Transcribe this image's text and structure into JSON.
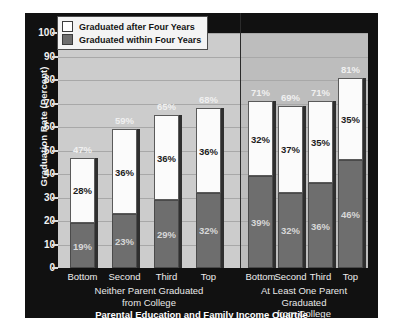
{
  "chart_data": {
    "type": "bar",
    "subtype": "stacked-grouped",
    "title": "",
    "xlabel": "Parental Education and Family Income Quartile",
    "ylabel": "Graduation Rate (Percent)",
    "ylim": [
      0,
      100
    ],
    "ytick_values": [
      0,
      10,
      20,
      30,
      40,
      50,
      60,
      70,
      80,
      90,
      100
    ],
    "ytick_labels": [
      "0",
      "10",
      "20",
      "30",
      "40",
      "50",
      "60",
      "70",
      "80",
      "90",
      "100"
    ],
    "grid": true,
    "legend_position": "upper-left-inside",
    "legend": [
      {
        "key": "after",
        "label": "Graduated after Four Years",
        "color": "#ffffff"
      },
      {
        "key": "within",
        "label": "Graduated within Four Years",
        "color": "#6e6e6e"
      }
    ],
    "categories": [
      "Bottom",
      "Second",
      "Third",
      "Top"
    ],
    "groups": [
      {
        "caption_line1": "Neither Parent Graduated",
        "caption_line2": "from College",
        "bars": [
          {
            "category": "Bottom",
            "within": 19,
            "after": 28,
            "total": 47,
            "within_label": "19%",
            "after_label": "28%",
            "total_label": "47%"
          },
          {
            "category": "Second",
            "within": 23,
            "after": 36,
            "total": 59,
            "within_label": "23%",
            "after_label": "36%",
            "total_label": "59%"
          },
          {
            "category": "Third",
            "within": 29,
            "after": 36,
            "total": 65,
            "within_label": "29%",
            "after_label": "36%",
            "total_label": "65%"
          },
          {
            "category": "Top",
            "within": 32,
            "after": 36,
            "total": 68,
            "within_label": "32%",
            "after_label": "36%",
            "total_label": "68%"
          }
        ]
      },
      {
        "caption_line1": "At Least One Parent Graduated",
        "caption_line2": "from College",
        "bars": [
          {
            "category": "Bottom",
            "within": 39,
            "after": 32,
            "total": 71,
            "within_label": "39%",
            "after_label": "32%",
            "total_label": "71%"
          },
          {
            "category": "Second",
            "within": 32,
            "after": 37,
            "total": 69,
            "within_label": "32%",
            "after_label": "37%",
            "total_label": "69%"
          },
          {
            "category": "Third",
            "within": 36,
            "after": 35,
            "total": 71,
            "within_label": "36%",
            "after_label": "35%",
            "total_label": "71%"
          },
          {
            "category": "Top",
            "within": 46,
            "after": 35,
            "total": 81,
            "within_label": "46%",
            "after_label": "35%",
            "total_label": "81%"
          }
        ]
      }
    ],
    "colors": {
      "panel_background": "#111111",
      "plot_background_left": "#cccccc",
      "plot_background_right": "#bdbdbd",
      "gridline": "#a8a8a8",
      "bar_after": "#fbfbfb",
      "bar_within": "#6e6e6e",
      "axis_text": "#f2f2f2"
    }
  }
}
